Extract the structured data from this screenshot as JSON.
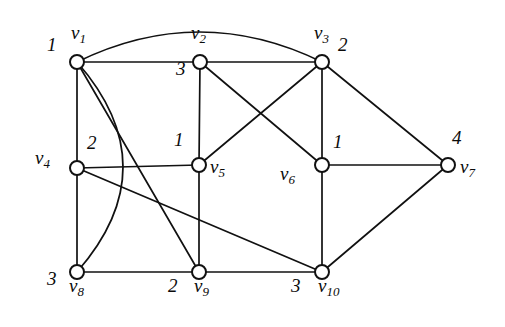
{
  "figure": {
    "kind": "undirected-graph-diagram",
    "width": 505,
    "height": 327,
    "background_color": "#ffffff",
    "line_color": "#111111",
    "vertex_fill": "#ffffff"
  },
  "chart_data": {
    "type": "diagram",
    "title": "",
    "vertices": [
      {
        "id": "v1",
        "name": "v",
        "index": "1",
        "label": "1",
        "x": 77,
        "y": 62,
        "name_dx": -6,
        "name_dy": -30,
        "num_dx": -30,
        "num_dy": -18
      },
      {
        "id": "v2",
        "name": "v",
        "index": "2",
        "label": "3",
        "x": 200,
        "y": 62,
        "name_dx": -9,
        "name_dy": -30,
        "num_dx": -24,
        "num_dy": 6
      },
      {
        "id": "v3",
        "name": "v",
        "index": "3",
        "label": "2",
        "x": 322,
        "y": 62,
        "name_dx": -8,
        "name_dy": -30,
        "num_dx": 16,
        "num_dy": -18
      },
      {
        "id": "v4",
        "name": "v",
        "index": "4",
        "label": "2",
        "x": 77,
        "y": 168,
        "name_dx": -42,
        "name_dy": -11,
        "num_dx": 10,
        "num_dy": -26
      },
      {
        "id": "v5",
        "name": "v",
        "index": "5",
        "label": "1",
        "x": 199,
        "y": 165,
        "name_dx": 11,
        "name_dy": 1,
        "num_dx": -25,
        "num_dy": -26
      },
      {
        "id": "v6",
        "name": "v",
        "index": "6",
        "label": "1",
        "x": 322,
        "y": 165,
        "name_dx": -42,
        "name_dy": 8,
        "num_dx": 11,
        "num_dy": -24
      },
      {
        "id": "v7",
        "name": "v",
        "index": "7",
        "label": "4",
        "x": 448,
        "y": 165,
        "name_dx": 12,
        "name_dy": 1,
        "num_dx": 4,
        "num_dy": -28
      },
      {
        "id": "v8",
        "name": "v",
        "index": "8",
        "label": "3",
        "x": 77,
        "y": 272,
        "name_dx": -8,
        "name_dy": 13,
        "num_dx": -30,
        "num_dy": 6
      },
      {
        "id": "v9",
        "name": "v",
        "index": "9",
        "label": "2",
        "x": 199,
        "y": 272,
        "name_dx": -5,
        "name_dy": 13,
        "num_dx": -31,
        "num_dy": 13
      },
      {
        "id": "v10",
        "name": "v",
        "index": "10",
        "label": "3",
        "x": 322,
        "y": 272,
        "name_dx": -4,
        "name_dy": 13,
        "num_dx": -31,
        "num_dy": 13
      }
    ],
    "vertex_radius": 7,
    "edges": [
      {
        "from": "v1",
        "to": "v2",
        "shape": "line"
      },
      {
        "from": "v2",
        "to": "v3",
        "shape": "line"
      },
      {
        "from": "v1",
        "to": "v3",
        "shape": "arc",
        "bulge": -30
      },
      {
        "from": "v1",
        "to": "v4",
        "shape": "line"
      },
      {
        "from": "v1",
        "to": "v8",
        "shape": "arc",
        "bulge": -46
      },
      {
        "from": "v1",
        "to": "v9",
        "shape": "line"
      },
      {
        "from": "v2",
        "to": "v5",
        "shape": "line"
      },
      {
        "from": "v2",
        "to": "v6",
        "shape": "line"
      },
      {
        "from": "v3",
        "to": "v5",
        "shape": "line"
      },
      {
        "from": "v3",
        "to": "v6",
        "shape": "line"
      },
      {
        "from": "v3",
        "to": "v7",
        "shape": "line"
      },
      {
        "from": "v4",
        "to": "v5",
        "shape": "line"
      },
      {
        "from": "v4",
        "to": "v8",
        "shape": "line"
      },
      {
        "from": "v4",
        "to": "v10",
        "shape": "line"
      },
      {
        "from": "v5",
        "to": "v9",
        "shape": "line"
      },
      {
        "from": "v6",
        "to": "v7",
        "shape": "line"
      },
      {
        "from": "v6",
        "to": "v10",
        "shape": "line"
      },
      {
        "from": "v7",
        "to": "v10",
        "shape": "line"
      },
      {
        "from": "v8",
        "to": "v9",
        "shape": "line"
      },
      {
        "from": "v9",
        "to": "v10",
        "shape": "line"
      }
    ]
  }
}
